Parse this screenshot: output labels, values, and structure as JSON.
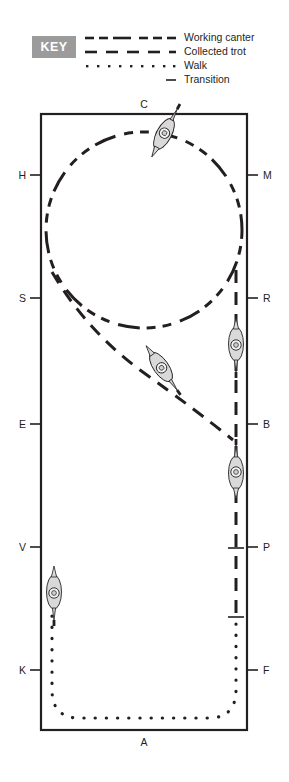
{
  "legend": {
    "badge_label": "KEY",
    "badge_color": "#9b9b9b",
    "items": [
      {
        "label": "Working canter",
        "style": "dash-dot-long"
      },
      {
        "label": "Collected trot",
        "style": "dashed"
      },
      {
        "label": "Walk",
        "style": "dotted"
      },
      {
        "label": "Transition",
        "style": "short-solid"
      }
    ]
  },
  "arena": {
    "outline_color": "#231f20",
    "letters_top": [
      {
        "label": "C"
      }
    ],
    "letters_bottom": [
      {
        "label": "A"
      }
    ],
    "letters_left": [
      {
        "label": "H"
      },
      {
        "label": "S"
      },
      {
        "label": "E"
      },
      {
        "label": "V"
      },
      {
        "label": "K"
      }
    ],
    "letters_right": [
      {
        "label": "M"
      },
      {
        "label": "R"
      },
      {
        "label": "B"
      },
      {
        "label": "P"
      },
      {
        "label": "F"
      }
    ]
  },
  "movements": [
    {
      "name": "20m circle at C",
      "gait": "Working canter",
      "style": "dash-dot-long"
    },
    {
      "name": "Diagonal S to B",
      "gait": "Collected trot",
      "style": "dashed"
    },
    {
      "name": "Right track B to P",
      "gait": "Collected trot",
      "style": "dashed"
    },
    {
      "name": "Transition at P",
      "gait": "Transition",
      "style": "short-solid"
    },
    {
      "name": "Walk F around A to K",
      "gait": "Walk",
      "style": "dotted"
    },
    {
      "name": "Walk up left track to V",
      "gait": "Walk",
      "style": "dotted"
    }
  ],
  "riders": [
    {
      "id": "rider-circle-top",
      "heading": "right-down"
    },
    {
      "id": "rider-diagonal",
      "heading": "down-right"
    },
    {
      "id": "rider-right-upper",
      "heading": "down"
    },
    {
      "id": "rider-right-lower",
      "heading": "up"
    },
    {
      "id": "rider-left-walk",
      "heading": "down"
    }
  ]
}
